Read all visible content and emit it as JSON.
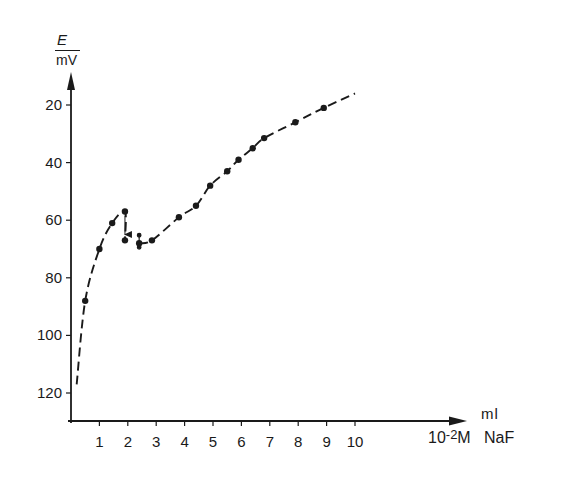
{
  "chart_data": {
    "type": "line",
    "title": "",
    "xlabel": "ml 10^-2 M NaF",
    "xlabel_line1": "ml",
    "xlabel_line2_base": "10",
    "xlabel_line2_exp": "-2",
    "xlabel_line2_rest": "M   NaF",
    "ylabel_symbol": "E",
    "ylabel_unit": "mV",
    "y_inverted": true,
    "xlim": [
      0,
      10.5
    ],
    "ylim": [
      130,
      12
    ],
    "grid": false,
    "legend": null,
    "x_ticks": [
      "1",
      "2",
      "3",
      "4",
      "5",
      "6",
      "7",
      "8",
      "9",
      "10"
    ],
    "y_ticks": [
      "20",
      "40",
      "60",
      "80",
      "100",
      "120"
    ],
    "series": [
      {
        "name": "Titration curve",
        "style": "dashed line with filled markers",
        "points": [
          {
            "x": 0.5,
            "y": 88
          },
          {
            "x": 1.0,
            "y": 70
          },
          {
            "x": 1.45,
            "y": 61
          },
          {
            "x": 1.9,
            "y": 57
          },
          {
            "x": 1.9,
            "y": 67
          },
          {
            "x": 2.4,
            "y": 68
          },
          {
            "x": 2.85,
            "y": 67
          },
          {
            "x": 3.8,
            "y": 59
          },
          {
            "x": 4.4,
            "y": 55
          },
          {
            "x": 4.9,
            "y": 48
          },
          {
            "x": 5.5,
            "y": 43
          },
          {
            "x": 5.9,
            "y": 39
          },
          {
            "x": 6.4,
            "y": 35
          },
          {
            "x": 6.8,
            "y": 31.5
          },
          {
            "x": 7.9,
            "y": 26
          },
          {
            "x": 8.9,
            "y": 21
          }
        ],
        "curve_start": {
          "x": 0.2,
          "y": 117
        },
        "curve_end": {
          "x": 10.0,
          "y": 16
        }
      }
    ],
    "annotations": [
      {
        "type": "arrow",
        "from": {
          "x": 1.9,
          "y": 57
        },
        "to": {
          "x": 1.9,
          "y": 66
        },
        "note": "drop in potential"
      },
      {
        "type": "error-bar-marker",
        "at": {
          "x": 2.4,
          "y": 68
        }
      }
    ]
  }
}
